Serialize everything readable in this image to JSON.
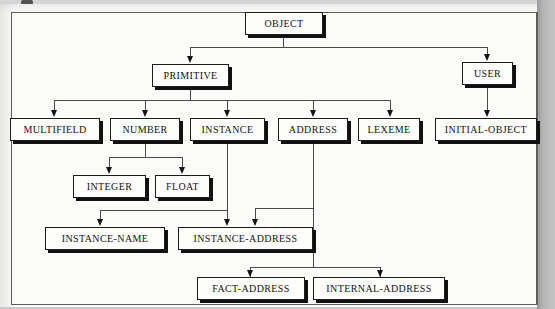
{
  "figure": {
    "type": "hierarchy-tree-diagram",
    "root": "OBJECT",
    "orientation": "top-down"
  },
  "nodes": {
    "object": "OBJECT",
    "primitive": "PRIMITIVE",
    "user": "USER",
    "multifield": "MULTIFIELD",
    "number": "NUMBER",
    "instance": "INSTANCE",
    "address": "ADDRESS",
    "lexeme": "LEXEME",
    "initial_object": "INITIAL-OBJECT",
    "integer": "INTEGER",
    "float": "FLOAT",
    "instance_name": "INSTANCE-NAME",
    "instance_address": "INSTANCE-ADDRESS",
    "fact_address": "FACT-ADDRESS",
    "internal_address": "INTERNAL-ADDRESS"
  },
  "edges": [
    {
      "from": "OBJECT",
      "to": "PRIMITIVE"
    },
    {
      "from": "OBJECT",
      "to": "USER"
    },
    {
      "from": "PRIMITIVE",
      "to": "MULTIFIELD"
    },
    {
      "from": "PRIMITIVE",
      "to": "NUMBER"
    },
    {
      "from": "PRIMITIVE",
      "to": "INSTANCE"
    },
    {
      "from": "PRIMITIVE",
      "to": "ADDRESS"
    },
    {
      "from": "PRIMITIVE",
      "to": "LEXEME"
    },
    {
      "from": "USER",
      "to": "INITIAL-OBJECT"
    },
    {
      "from": "NUMBER",
      "to": "INTEGER"
    },
    {
      "from": "NUMBER",
      "to": "FLOAT"
    },
    {
      "from": "INSTANCE",
      "to": "INSTANCE-NAME"
    },
    {
      "from": "INSTANCE",
      "to": "INSTANCE-ADDRESS"
    },
    {
      "from": "ADDRESS",
      "to": "INSTANCE-ADDRESS"
    },
    {
      "from": "ADDRESS",
      "to": "FACT-ADDRESS"
    },
    {
      "from": "ADDRESS",
      "to": "INTERNAL-ADDRESS"
    }
  ],
  "colors": {
    "node_fill": "#fdfdfc",
    "node_border": "#1b1b1b",
    "node_shadow": "#111111",
    "connector": "#4a4a4a",
    "page": "#fbfbfa",
    "gutter": "#b5b5b5"
  }
}
